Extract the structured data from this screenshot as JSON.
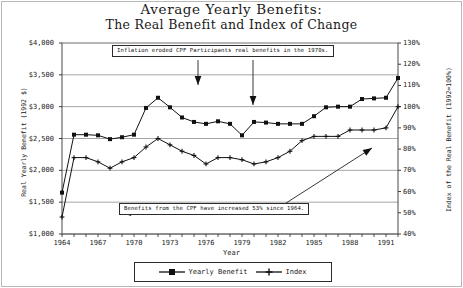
{
  "chart_data": {
    "type": "line",
    "title": "Average Yearly Benefits:",
    "subtitle": "The Real Benefit and Index of Change",
    "xlabel": "Year",
    "ylabel": "Real Yearly Benefit (1992 $)",
    "ylabel_right": "Index of the Real Benefit (1992=100%)",
    "grid": true,
    "legend_position": "bottom",
    "ylim": [
      1000,
      4000
    ],
    "ylim_right": [
      40,
      130
    ],
    "xlim": [
      1964,
      1992
    ],
    "yticks": [
      "$1,000",
      "$1,500",
      "$2,000",
      "$2,500",
      "$3,000",
      "$3,500",
      "$4,000"
    ],
    "ytick_values": [
      1000,
      1500,
      2000,
      2500,
      3000,
      3500,
      4000
    ],
    "yticks_right": [
      "40%",
      "50%",
      "60%",
      "70%",
      "80%",
      "90%",
      "100%",
      "110%",
      "120%",
      "130%"
    ],
    "ytick_right_values": [
      40,
      50,
      60,
      70,
      80,
      90,
      100,
      110,
      120,
      130
    ],
    "xticks": [
      "1964",
      "1967",
      "1970",
      "1973",
      "1976",
      "1979",
      "1982",
      "1985",
      "1988",
      "1991"
    ],
    "xtick_values": [
      1964,
      1967,
      1970,
      1973,
      1976,
      1979,
      1982,
      1985,
      1988,
      1991
    ],
    "x": [
      1964,
      1965,
      1966,
      1967,
      1968,
      1969,
      1970,
      1971,
      1972,
      1973,
      1974,
      1975,
      1976,
      1977,
      1978,
      1979,
      1980,
      1981,
      1982,
      1983,
      1984,
      1985,
      1986,
      1987,
      1988,
      1989,
      1990,
      1991,
      1992
    ],
    "series": [
      {
        "name": "Yearly Benefit",
        "axis": "left",
        "marker": "square",
        "color": "#111111",
        "values": [
          1650,
          2560,
          2560,
          2550,
          2490,
          2520,
          2560,
          2980,
          3140,
          2990,
          2830,
          2760,
          2730,
          2770,
          2730,
          2550,
          2760,
          2750,
          2730,
          2730,
          2730,
          2850,
          2990,
          3000,
          3000,
          3120,
          3130,
          3140,
          3450
        ]
      },
      {
        "name": "Index",
        "axis": "right",
        "marker": "plus",
        "color": "#111111",
        "values": [
          48,
          76,
          76,
          74,
          71,
          74,
          76,
          81,
          85,
          82,
          79,
          77,
          73,
          76,
          76,
          75,
          73,
          74,
          76,
          79,
          84,
          86,
          86,
          86,
          89,
          89,
          89,
          90,
          100
        ]
      }
    ],
    "annotations": [
      {
        "name": "inflation-callout",
        "text": "Inflation eroded CPF Participants real benefits in the 1970s.",
        "arrows": 2
      },
      {
        "name": "increase-callout",
        "text": "Benefits from the CPF have increased 53% since 1964.",
        "arrows": 1
      }
    ]
  },
  "legend": {
    "items": [
      {
        "label": "Yearly Benefit",
        "marker": "square"
      },
      {
        "label": "Index",
        "marker": "plus"
      }
    ]
  }
}
